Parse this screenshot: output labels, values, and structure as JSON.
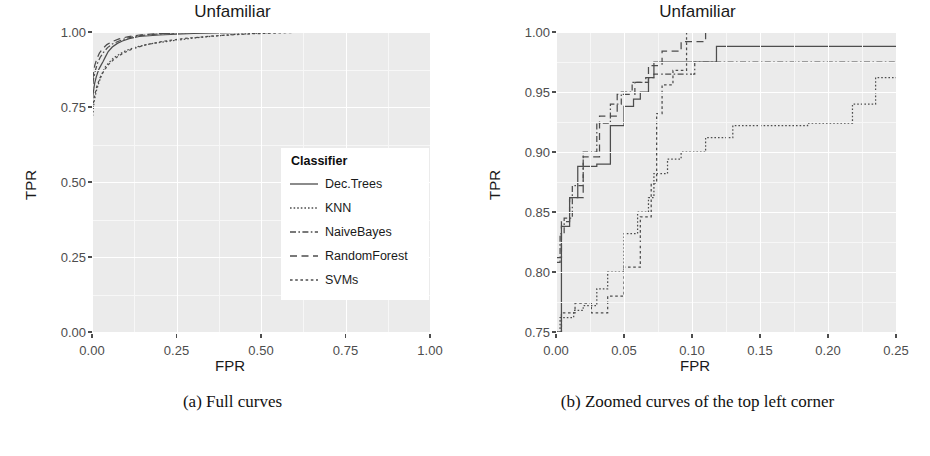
{
  "figure": {
    "panels": [
      {
        "id": "full-curves",
        "title": "Unfamiliar",
        "caption": "(a) Full curves",
        "xlabel": "FPR",
        "ylabel": "TPR",
        "xticks": [
          "0.00",
          "0.25",
          "0.50",
          "0.75",
          "1.00"
        ],
        "yticks": [
          "0.00",
          "0.25",
          "0.50",
          "0.75",
          "1.00"
        ]
      },
      {
        "id": "zoomed-curves",
        "title": "Unfamiliar",
        "caption": "(b) Zoomed curves of the top left corner",
        "xlabel": "FPR",
        "ylabel": "TPR",
        "xticks": [
          "0.00",
          "0.05",
          "0.10",
          "0.15",
          "0.20",
          "0.25"
        ],
        "yticks": [
          "0.75",
          "0.80",
          "0.85",
          "0.90",
          "0.95",
          "1.00"
        ]
      }
    ],
    "legend": {
      "title": "Classifier",
      "items": [
        {
          "label": "Dec.Trees",
          "style": "solid",
          "dash": "none"
        },
        {
          "label": "KNN",
          "style": "dotted",
          "dash": "1.6,2.0"
        },
        {
          "label": "NaiveBayes",
          "style": "dashdot",
          "dash": "6,2.4,1.6,2.4"
        },
        {
          "label": "RandomForest",
          "style": "longdash",
          "dash": "7,4.5"
        },
        {
          "label": "SVMs",
          "style": "twodash",
          "dash": "2.6,2.6"
        }
      ]
    },
    "colors": {
      "panel_background": "#ebebeb",
      "gridline": "#ffffff",
      "line": "#4d4d4d",
      "text": "#1a1a1a",
      "tick_text": "#4d4d4d"
    }
  },
  "chart_data": {
    "type": "line",
    "title": "Unfamiliar",
    "xlabel": "FPR",
    "ylabel": "TPR",
    "panel_a": {
      "title": "Unfamiliar",
      "subtitle": "(a) Full curves",
      "xlim": [
        0.0,
        1.0
      ],
      "ylim": [
        0.0,
        1.0
      ],
      "xticks": [
        0.0,
        0.25,
        0.5,
        0.75,
        1.0
      ],
      "yticks": [
        0.0,
        0.25,
        0.5,
        0.75,
        1.0
      ],
      "grid": true,
      "legend_position": "inside-right-middle",
      "series": [
        {
          "name": "Dec.Trees",
          "x": [
            0.0,
            0.0,
            0.004,
            0.008,
            0.012,
            0.016,
            0.02,
            0.026,
            0.032,
            0.04,
            0.048,
            0.06,
            0.075,
            0.09,
            0.11,
            0.14,
            0.2,
            0.3,
            0.5,
            0.75,
            1.0
          ],
          "y": [
            0.0,
            0.76,
            0.8,
            0.83,
            0.848,
            0.862,
            0.875,
            0.888,
            0.9,
            0.918,
            0.935,
            0.95,
            0.962,
            0.97,
            0.978,
            0.985,
            0.99,
            0.995,
            1.0,
            1.0,
            1.0
          ]
        },
        {
          "name": "KNN",
          "x": [
            0.0,
            0.0,
            0.006,
            0.012,
            0.02,
            0.03,
            0.04,
            0.052,
            0.065,
            0.08,
            0.1,
            0.13,
            0.17,
            0.22,
            0.3,
            0.42,
            0.56,
            0.75,
            1.0
          ],
          "y": [
            0.0,
            0.7,
            0.765,
            0.8,
            0.83,
            0.862,
            0.885,
            0.9,
            0.915,
            0.925,
            0.938,
            0.95,
            0.96,
            0.968,
            0.98,
            0.992,
            1.0,
            1.0,
            1.0
          ]
        },
        {
          "name": "NaiveBayes",
          "x": [
            0.0,
            0.0,
            0.004,
            0.01,
            0.016,
            0.024,
            0.034,
            0.046,
            0.06,
            0.08,
            0.105,
            0.14,
            0.19,
            0.26,
            0.36,
            0.5,
            0.7,
            1.0
          ],
          "y": [
            0.0,
            0.79,
            0.84,
            0.872,
            0.895,
            0.915,
            0.932,
            0.948,
            0.96,
            0.97,
            0.98,
            0.988,
            0.993,
            0.997,
            1.0,
            1.0,
            1.0,
            1.0
          ]
        },
        {
          "name": "RandomForest",
          "x": [
            0.0,
            0.0,
            0.004,
            0.008,
            0.014,
            0.022,
            0.032,
            0.044,
            0.06,
            0.08,
            0.105,
            0.14,
            0.185,
            0.25,
            0.34,
            0.46,
            0.62,
            0.82,
            1.0
          ],
          "y": [
            0.0,
            0.81,
            0.858,
            0.888,
            0.91,
            0.93,
            0.945,
            0.958,
            0.968,
            0.977,
            0.984,
            0.99,
            0.994,
            0.997,
            0.999,
            1.0,
            1.0,
            1.0,
            1.0
          ]
        },
        {
          "name": "SVMs",
          "x": [
            0.0,
            0.0,
            0.006,
            0.014,
            0.024,
            0.036,
            0.05,
            0.068,
            0.09,
            0.118,
            0.155,
            0.205,
            0.27,
            0.36,
            0.47,
            0.61,
            0.79,
            1.0
          ],
          "y": [
            0.0,
            0.72,
            0.78,
            0.818,
            0.848,
            0.872,
            0.893,
            0.912,
            0.928,
            0.943,
            0.956,
            0.968,
            0.978,
            0.987,
            0.994,
            0.999,
            1.0,
            1.0
          ]
        }
      ]
    },
    "panel_b": {
      "title": "Unfamiliar",
      "subtitle": "(b) Zoomed curves of the top left corner",
      "xlim": [
        0.0,
        0.25
      ],
      "ylim": [
        0.75,
        1.0
      ],
      "xticks": [
        0.0,
        0.05,
        0.1,
        0.15,
        0.2,
        0.25
      ],
      "yticks": [
        0.75,
        0.8,
        0.85,
        0.9,
        0.95,
        1.0
      ],
      "grid": true,
      "legend_position": "none",
      "series": [
        {
          "name": "Dec.Trees",
          "x": [
            0.0,
            0.004,
            0.004,
            0.01,
            0.01,
            0.016,
            0.016,
            0.03,
            0.03,
            0.04,
            0.04,
            0.05,
            0.05,
            0.057,
            0.057,
            0.062,
            0.062,
            0.068,
            0.068,
            0.072,
            0.072,
            0.118,
            0.118,
            0.142,
            0.142,
            0.25
          ],
          "y": [
            0.75,
            0.75,
            0.838,
            0.838,
            0.862,
            0.862,
            0.888,
            0.888,
            0.89,
            0.89,
            0.922,
            0.922,
            0.938,
            0.938,
            0.944,
            0.944,
            0.95,
            0.95,
            0.962,
            0.962,
            0.975,
            0.975,
            0.988,
            0.988,
            0.988,
            0.988
          ]
        },
        {
          "name": "KNN",
          "x": [
            0.0,
            0.003,
            0.003,
            0.013,
            0.013,
            0.02,
            0.02,
            0.03,
            0.03,
            0.038,
            0.038,
            0.05,
            0.05,
            0.06,
            0.06,
            0.068,
            0.068,
            0.072,
            0.072,
            0.082,
            0.082,
            0.092,
            0.092,
            0.11,
            0.11,
            0.13,
            0.13,
            0.185,
            0.185,
            0.218,
            0.218,
            0.235,
            0.235,
            0.25
          ],
          "y": [
            0.75,
            0.75,
            0.762,
            0.762,
            0.768,
            0.768,
            0.772,
            0.772,
            0.786,
            0.786,
            0.8,
            0.8,
            0.832,
            0.832,
            0.85,
            0.85,
            0.862,
            0.862,
            0.882,
            0.882,
            0.894,
            0.894,
            0.9,
            0.9,
            0.912,
            0.912,
            0.922,
            0.922,
            0.924,
            0.924,
            0.94,
            0.94,
            0.962,
            0.962
          ]
        },
        {
          "name": "NaiveBayes",
          "x": [
            0.0,
            0.003,
            0.003,
            0.006,
            0.006,
            0.012,
            0.012,
            0.02,
            0.02,
            0.03,
            0.03,
            0.04,
            0.04,
            0.048,
            0.048,
            0.056,
            0.056,
            0.066,
            0.066,
            0.072,
            0.072,
            0.102,
            0.102,
            0.25
          ],
          "y": [
            0.808,
            0.808,
            0.832,
            0.832,
            0.845,
            0.845,
            0.872,
            0.872,
            0.9,
            0.9,
            0.924,
            0.924,
            0.94,
            0.94,
            0.95,
            0.95,
            0.958,
            0.958,
            0.962,
            0.962,
            0.965,
            0.965,
            0.975,
            0.975
          ]
        },
        {
          "name": "RandomForest",
          "x": [
            0.0,
            0.004,
            0.004,
            0.01,
            0.01,
            0.02,
            0.02,
            0.032,
            0.032,
            0.045,
            0.045,
            0.058,
            0.058,
            0.068,
            0.068,
            0.078,
            0.078,
            0.092,
            0.092,
            0.11,
            0.11,
            0.25
          ],
          "y": [
            0.812,
            0.812,
            0.842,
            0.842,
            0.862,
            0.862,
            0.896,
            0.896,
            0.93,
            0.93,
            0.948,
            0.948,
            0.958,
            0.958,
            0.972,
            0.972,
            0.984,
            0.984,
            0.992,
            0.992,
            1.0,
            1.0
          ]
        },
        {
          "name": "SVMs",
          "x": [
            0.0,
            0.004,
            0.004,
            0.014,
            0.014,
            0.026,
            0.026,
            0.038,
            0.038,
            0.05,
            0.05,
            0.062,
            0.062,
            0.07,
            0.07,
            0.074,
            0.074,
            0.078,
            0.078,
            0.086,
            0.086,
            0.096,
            0.096,
            0.25
          ],
          "y": [
            0.75,
            0.75,
            0.766,
            0.766,
            0.774,
            0.774,
            0.766,
            0.766,
            0.78,
            0.78,
            0.804,
            0.804,
            0.846,
            0.846,
            0.874,
            0.874,
            0.932,
            0.932,
            0.956,
            0.956,
            0.968,
            0.968,
            1.0,
            1.0
          ]
        }
      ]
    }
  }
}
